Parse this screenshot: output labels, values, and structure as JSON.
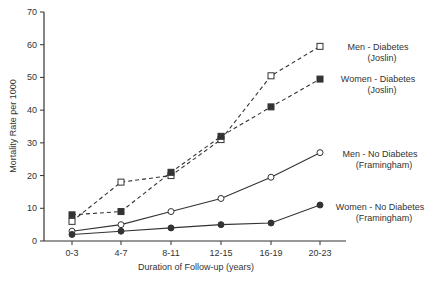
{
  "chart_data": {
    "type": "line",
    "title": "",
    "xlabel": "Duration of Follow-up (years)",
    "ylabel": "Mortality Rate per 1000",
    "ylim": [
      0,
      70
    ],
    "yticks": [
      0,
      10,
      20,
      30,
      40,
      50,
      60,
      70
    ],
    "grid": false,
    "legend_position": "inline-right",
    "categories": [
      "0-3",
      "4-7",
      "8-11",
      "12-15",
      "16-19",
      "20-23"
    ],
    "series": [
      {
        "name": "Men - Diabetes (Joslin)",
        "label_line1": "Men -  Diabetes",
        "label_line2": "(Joslin)",
        "marker": "open-square",
        "line": "dashed",
        "values": [
          6,
          18,
          20,
          31,
          50.5,
          59.5
        ]
      },
      {
        "name": "Women - Diabetes (Joslin)",
        "label_line1": "Women - Diabetes",
        "label_line2": "(Joslin)",
        "marker": "filled-square",
        "line": "dashed",
        "values": [
          8,
          9,
          21,
          32,
          41,
          49.5
        ]
      },
      {
        "name": "Men - No Diabetes (Framingham)",
        "label_line1": "Men - No Diabetes",
        "label_line2": "(Framingham)",
        "marker": "open-circle",
        "line": "solid",
        "values": [
          3,
          5,
          9,
          13,
          19.5,
          27
        ]
      },
      {
        "name": "Women - No Diabetes (Framingham)",
        "label_line1": "Women - No Diabetes",
        "label_line2": "(Framingham)",
        "marker": "filled-circle",
        "line": "solid",
        "values": [
          2,
          3,
          4,
          5,
          5.5,
          11
        ]
      }
    ]
  },
  "colors": {
    "line": "#333333",
    "background": "#ffffff"
  }
}
